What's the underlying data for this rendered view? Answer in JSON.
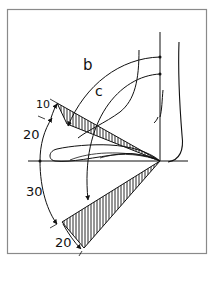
{
  "figure": {
    "labels": {
      "b": "b",
      "c": "c",
      "upper_small": "10",
      "upper_large": "20",
      "lower_large": "30",
      "lower_small": "20"
    },
    "colors": {
      "line": "#111111",
      "frame": "#8a8a8a",
      "background": "#ffffff"
    }
  }
}
